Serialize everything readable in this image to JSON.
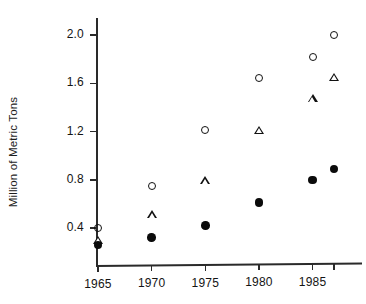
{
  "chart_data": {
    "type": "scatter",
    "title": "",
    "xlabel": "",
    "ylabel": "Million of Metric Tons",
    "x": [
      1965,
      1970,
      1975,
      1980,
      1985,
      1987
    ],
    "xlim": [
      1963,
      1989
    ],
    "ylim": [
      0.16,
      2.12
    ],
    "grid": false,
    "legend": "none",
    "xticks": [
      {
        "value": 1965,
        "label": "1965"
      },
      {
        "value": 1970,
        "label": "1970"
      },
      {
        "value": 1975,
        "label": "1975"
      },
      {
        "value": 1980,
        "label": "1980"
      },
      {
        "value": 1985,
        "label": "1985"
      },
      {
        "value": 1987,
        "label": ""
      }
    ],
    "yticks": [
      {
        "value": 0.4,
        "label": "0.4"
      },
      {
        "value": 0.8,
        "label": "0.8"
      },
      {
        "value": 1.2,
        "label": "1.2"
      },
      {
        "value": 1.6,
        "label": "1.6"
      },
      {
        "value": 2.0,
        "label": "2.0"
      }
    ],
    "series": [
      {
        "name": "open-circle",
        "marker": "open-circle",
        "values": [
          0.4,
          0.75,
          1.21,
          1.64,
          1.82,
          2.0
        ]
      },
      {
        "name": "open-triangle",
        "marker": "open-triangle",
        "values": [
          0.3,
          0.51,
          0.79,
          1.21,
          1.47,
          1.65
        ]
      },
      {
        "name": "filled-circle",
        "marker": "filled-circle",
        "values": [
          0.26,
          0.32,
          0.42,
          0.61,
          0.8,
          0.89
        ]
      }
    ]
  }
}
